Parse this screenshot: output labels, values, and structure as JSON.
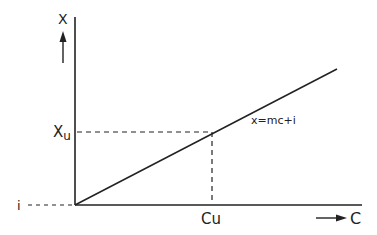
{
  "diagram": {
    "type": "linear-function-graph",
    "equation_label": "x=mc+i",
    "y_axis": {
      "label": "X",
      "arrow": "up"
    },
    "x_axis": {
      "label": "C",
      "arrow": "right"
    },
    "markers": {
      "x_u": "X",
      "x_u_sub": "u",
      "c_u": "Cu",
      "intercept": "i"
    },
    "colors": {
      "stroke": "#222222",
      "background": "#ffffff"
    }
  }
}
